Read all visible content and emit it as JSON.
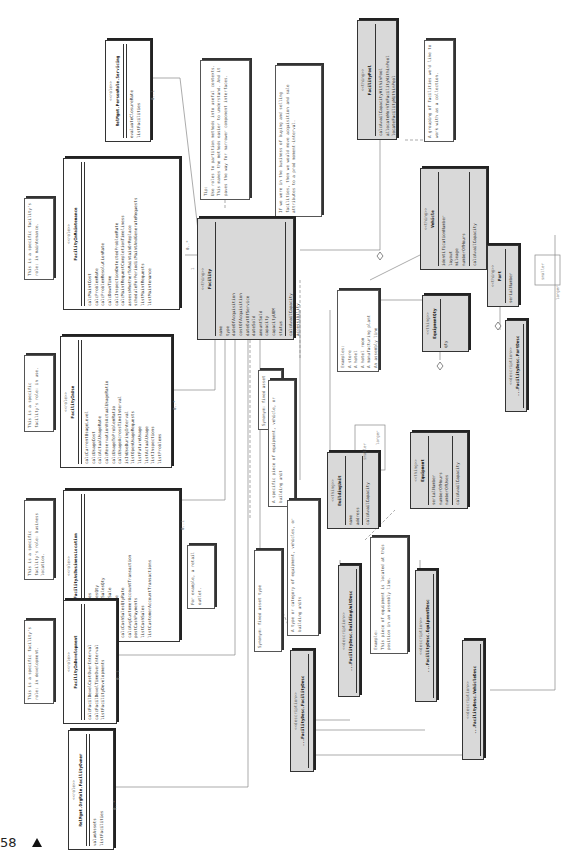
{
  "page": {
    "number": "58",
    "marker_icon": "triangle-up"
  },
  "classes": {
    "facility": {
      "stereotype": "<<thing>>",
      "name": "Facility",
      "attributes": [
        "name",
        "type",
        "dateOfAcquisition",
        "costOfAcquisition",
        "dateOutOfService",
        "dateSold",
        "amountSold",
        "capacity",
        "capacityUOM",
        "status",
        "calcAvailCapacity",
        "accessibility"
      ]
    },
    "facility_pool": {
      "stereotype": "<<thing>>",
      "name": "FacilityPool",
      "attributes": [
        "calcAvailCapacityWithinPool",
        "allocateWorkToFacilityWithinPool",
        "locateFacilityWithinPool"
      ]
    },
    "vehicle": {
      "stereotype": "<<thing>>",
      "name": "Vehicle",
      "attributes": [
        "identificationNumber",
        "layout",
        "mileage",
        "numberOfHours",
        "calcAvailCapacity"
      ]
    },
    "part": {
      "stereotype": "<<thing>>",
      "name": "Part",
      "attributes": [
        "serialNumber"
      ]
    },
    "equipment_qty": {
      "stereotype": "<<thing>>",
      "name": "EquipmentQty",
      "attributes": [
        "qty"
      ]
    },
    "equipment": {
      "stereotype": "<<thing>>",
      "name": "Equipment",
      "attributes": [
        "serialNumber",
        "numberOfHours",
        "numberOfUses",
        "calcAvailCapacity"
      ]
    },
    "building_unit": {
      "stereotype": "<<thing>>",
      "name": "BuildingUnit",
      "attributes": [
        "name",
        "address",
        "calcAvailCapacity"
      ]
    },
    "facility_type": {
      "stereotype": "<<description>>",
      "name": "...FacilityDesc.FacilityDesc",
      "attributes": []
    },
    "building_unit_desc": {
      "stereotype": "<<description>>",
      "name": "...FacilityDesc.BuildingUnitDesc",
      "attributes": []
    },
    "equipment_desc": {
      "stereotype": "<<description>>",
      "name": "...FacilityDesc.EquipmentDesc",
      "attributes": []
    },
    "vehicle_desc": {
      "stereotype": "<<description>>",
      "name": "...FacilityDesc.VehicleDesc",
      "attributes": []
    },
    "part_desc": {
      "stereotype": "<<description>>",
      "name": "...FacilityDesc.PartDesc",
      "attributes": []
    },
    "in_maintenance": {
      "stereotype": "<<role>>",
      "name": "FacilityInMaintenance",
      "attributes": [
        "calcMaintCost",
        "calcProblemRate",
        "calcProblemResolutionRate",
        "calcDownTime",
        "calcInspectionDetectedProblemRate",
        "calcMaintRequestCompletionTimeliness",
        "assessWhetherToMaintainOrReplace",
        "scheduleForPeriodicMaintAndGenerateRequests",
        "listMaintRequests",
        "listMaintenance"
      ]
    },
    "in_use": {
      "stereotype": "<<role>>",
      "name": "FacilityInUse",
      "attributes": [
        "calcCurrentUsageLevel",
        "calcUsageCost",
        "calcActualUsageRate",
        "calcReservationVsActualUsageRatio",
        "calcUsageToProblemRatio",
        "calcUsageAcrossTimeInterval",
        "isInUseDuringInterval",
        "listOpenUsageRequests",
        "listFutureUsage",
        "listActualUsage",
        "listInspections",
        "listProblems"
      ]
    },
    "business_location": {
      "stereotype": "<<role>>",
      "name": "FacilityAsBusinessLocation",
      "attributes": [
        "calcTotalCashSales",
        "calcTotalCashSalesQty",
        "calcAvgTotalCashSalesQty",
        "calcAvgTotalCashSale",
        "calcCashSalesRate",
        "calcCashSalesQtyRate",
        "calcAvgCustomerAccountTransaction",
        "postCashPayments",
        "listCashSales",
        "listCustomerAccountTransactions"
      ]
    },
    "in_development": {
      "stereotype": "<<role>>",
      "name": "FacilityInDevelopment",
      "attributes": [
        "calcFacilDevelCostOverInterval",
        "calcFacilDevelTimeOverInterval",
        "listFacilityDevelopments"
      ]
    },
    "servicing": {
      "stereotype": "<<role>>",
      "name": "RelMgmt.PersonRole.Servicing",
      "attributes": [
        "evaluateClosureRate",
        "listFacilities"
      ]
    },
    "owner": {
      "stereotype": "<<role>>",
      "name": "RelMgmt.OrgRole.FacilityOwner",
      "attributes": [
        "valueAssets",
        "listFacilities"
      ]
    }
  },
  "notes": {
    "tip": "Tip:\nUse roles to partition methods into useful contexts. This makes the methods easier to understand. And it paves the way for narrower component interfaces.",
    "buying": "If we were in the business of buying and selling facilities, then we would move acquisition and sale attributes to a prod moment-interval.",
    "pool": "A grouping of facilities we'd like to work with as a collection.",
    "maint_role": "This is a specific facility's role: in maintenance.",
    "use_role": "This is a specific facility's role: in use.",
    "biz_role": "This is a specific facility's role: business location.",
    "dev_role": "This is a specific facility's role: in development.",
    "retail": "For example, a retail outlet.",
    "synonym_asset": "Synonym: fixed asset",
    "synonym_type": "Synonym: fixed asset type",
    "type_of": "A type or category of equipment, vehicles, or building units",
    "specific_piece": "A specific piece of equipment, vehicle, or building unit",
    "examples": "Examples:\nA store\nA hotel\nA hotel room\nA manufacturing plant\nAn assembly line",
    "equip_example": "Example:\nThis piece of equipment is located at this position in an assembly line."
  },
  "multiplicities": [
    "0..1",
    "0..*",
    "1",
    "0..*",
    "0..1",
    "0..1",
    "0..1",
    "0..*",
    "1",
    "0..*",
    "smaller",
    "larger",
    "0..*",
    "0..1",
    "smaller",
    "larger"
  ]
}
